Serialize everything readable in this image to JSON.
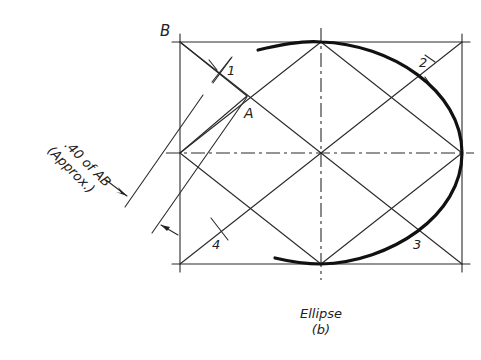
{
  "figure": {
    "labels": {
      "corner": "B",
      "point_a": "A",
      "pt1": "1",
      "pt2": "2",
      "pt3": "3",
      "pt4": "4"
    },
    "annotation": {
      "line1": ".40 of AB",
      "line2": "(Approx.)"
    },
    "caption": {
      "title": "Ellipse",
      "sub": "(b)"
    }
  }
}
